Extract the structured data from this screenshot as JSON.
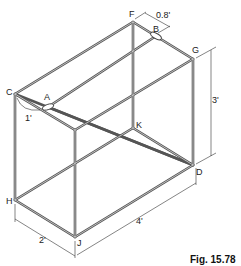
{
  "figure": {
    "caption": "Fig. 15.78",
    "vertex_labels": {
      "A": "A",
      "B": "B",
      "C": "C",
      "D": "D",
      "F": "F",
      "G": "G",
      "H": "H",
      "J": "J",
      "K": "K"
    },
    "dimensions": {
      "height": "3'",
      "length": "4'",
      "width": "2'",
      "offset_B": "0.8'",
      "offset_A": "1'"
    },
    "colors": {
      "rod": "#555555",
      "text": "#222222",
      "background": "#ffffff"
    }
  }
}
